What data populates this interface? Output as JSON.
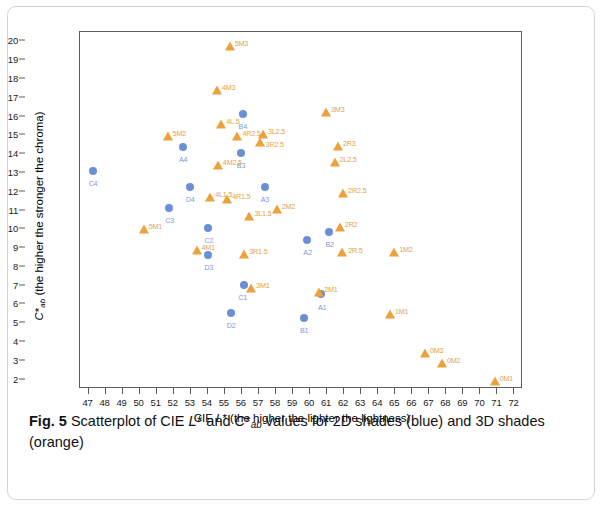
{
  "figure": {
    "label": "Fig. 5",
    "caption_part1": "Scatterplot of CIE ",
    "caption_italic1": "L",
    "caption_part2": "* and ",
    "caption_italic2": "C",
    "caption_part3": "*",
    "caption_sub": "ab",
    "caption_part4": " values for 2D shades (blue) and 3D shades (orange)"
  },
  "colors": {
    "blue_marker": "#6b8fd4",
    "blue_label": "#7e9ad6",
    "orange_marker": "#eda13c",
    "orange_label": "#e2a34a",
    "axis": "#5d5d5d",
    "card_border": "#d5d5d5"
  },
  "chart_data": {
    "type": "scatter",
    "title": "",
    "xlabel": "CIE L* (the higher the lighter the lightness)",
    "ylabel": "C*ab (the higher the stronger the chroma)",
    "xlabel_parts": {
      "pre": "CIE ",
      "italic": "L",
      "post": "* (the higher the lighter the lightness)"
    },
    "ylabel_parts": {
      "italic": "C",
      "star": "*",
      "sub": "ab",
      "post": " (the higher the stronger the chroma)"
    },
    "xlim": [
      46.5,
      72.5
    ],
    "ylim": [
      1.5,
      20.5
    ],
    "xticks": [
      47,
      48,
      49,
      50,
      51,
      52,
      53,
      54,
      55,
      56,
      57,
      58,
      59,
      60,
      61,
      62,
      63,
      64,
      65,
      66,
      67,
      68,
      69,
      70,
      71,
      72
    ],
    "yticks": [
      2,
      3,
      4,
      5,
      6,
      7,
      8,
      9,
      10,
      11,
      12,
      13,
      14,
      15,
      16,
      17,
      18,
      19,
      20
    ],
    "grid": false,
    "legend": "in-caption",
    "series": [
      {
        "name": "2D shades (blue)",
        "color": "#6b8fd4",
        "marker": "circle",
        "points": [
          {
            "label": "C4",
            "x": 47.3,
            "y": 13.05,
            "lx": -4,
            "ly": 9
          },
          {
            "label": "A4",
            "x": 52.6,
            "y": 14.3,
            "lx": -4,
            "ly": 9
          },
          {
            "label": "D4",
            "x": 53.0,
            "y": 12.2,
            "lx": -4,
            "ly": 9
          },
          {
            "label": "C3",
            "x": 51.8,
            "y": 11.1,
            "lx": -4,
            "ly": 9
          },
          {
            "label": "C2",
            "x": 54.1,
            "y": 10.0,
            "lx": -4,
            "ly": 9
          },
          {
            "label": "D3",
            "x": 54.1,
            "y": 8.6,
            "lx": -4,
            "ly": 9
          },
          {
            "label": "C1",
            "x": 56.2,
            "y": 7.0,
            "lx": -6,
            "ly": 9
          },
          {
            "label": "D2",
            "x": 55.4,
            "y": 5.5,
            "lx": -4,
            "ly": 9
          },
          {
            "label": "B1",
            "x": 59.7,
            "y": 5.25,
            "lx": -4,
            "ly": 9
          },
          {
            "label": "A1",
            "x": 60.7,
            "y": 6.5,
            "lx": -3,
            "ly": 10
          },
          {
            "label": "B2",
            "x": 61.2,
            "y": 9.8,
            "lx": -4,
            "ly": 9
          },
          {
            "label": "A2",
            "x": 59.9,
            "y": 9.4,
            "lx": -4,
            "ly": 9
          },
          {
            "label": "A3",
            "x": 57.4,
            "y": 12.2,
            "lx": -4,
            "ly": 9
          },
          {
            "label": "B3",
            "x": 56.0,
            "y": 14.0,
            "lx": -4,
            "ly": 9
          },
          {
            "label": "B4",
            "x": 56.1,
            "y": 16.1,
            "lx": -4,
            "ly": 9
          }
        ]
      },
      {
        "name": "3D shades (orange)",
        "color": "#eda13c",
        "marker": "triangle",
        "points": [
          {
            "label": "5M3",
            "x": 55.35,
            "y": 19.65,
            "lx": 5,
            "ly": -7
          },
          {
            "label": "4M3",
            "x": 54.6,
            "y": 17.3,
            "lx": 5,
            "ly": -7
          },
          {
            "label": "3M3",
            "x": 61.0,
            "y": 16.15,
            "lx": 5,
            "ly": -7
          },
          {
            "label": "5M2",
            "x": 51.7,
            "y": 14.85,
            "lx": 5,
            "ly": -7
          },
          {
            "label": "4L.5",
            "x": 54.85,
            "y": 15.5,
            "lx": 5,
            "ly": -7
          },
          {
            "label": "4R2.5",
            "x": 55.8,
            "y": 14.85,
            "lx": 5,
            "ly": -7
          },
          {
            "label": "3L2.5",
            "x": 57.3,
            "y": 14.95,
            "lx": 5,
            "ly": -7
          },
          {
            "label": "3R2.5",
            "x": 57.1,
            "y": 14.55,
            "lx": 6,
            "ly": -2
          },
          {
            "label": "2R3",
            "x": 61.7,
            "y": 14.35,
            "lx": 5,
            "ly": -7
          },
          {
            "label": "2L2.5",
            "x": 61.5,
            "y": 13.5,
            "lx": 5,
            "ly": -7
          },
          {
            "label": "4M2.5",
            "x": 54.65,
            "y": 13.3,
            "lx": 5,
            "ly": -7
          },
          {
            "label": "2R2.5",
            "x": 62.0,
            "y": 11.8,
            "lx": 5,
            "ly": -7
          },
          {
            "label": "5M1",
            "x": 50.3,
            "y": 9.9,
            "lx": 5,
            "ly": -7
          },
          {
            "label": "4L1.5",
            "x": 54.2,
            "y": 11.6,
            "lx": 5,
            "ly": -7
          },
          {
            "label": "4R1.5",
            "x": 55.2,
            "y": 11.5,
            "lx": 5,
            "ly": -7
          },
          {
            "label": "3L1.5",
            "x": 56.5,
            "y": 10.6,
            "lx": 5,
            "ly": -7
          },
          {
            "label": "2M2",
            "x": 58.1,
            "y": 11.0,
            "lx": 5,
            "ly": -7
          },
          {
            "label": "2R2",
            "x": 61.8,
            "y": 10.0,
            "lx": 5,
            "ly": -7
          },
          {
            "label": "4M1",
            "x": 53.4,
            "y": 8.8,
            "lx": 5,
            "ly": -7
          },
          {
            "label": "3R1.5",
            "x": 56.2,
            "y": 8.6,
            "lx": 5,
            "ly": -7
          },
          {
            "label": "2R.5",
            "x": 61.95,
            "y": 8.7,
            "lx": 6,
            "ly": -6
          },
          {
            "label": "1M2",
            "x": 65.0,
            "y": 8.7,
            "lx": 5,
            "ly": -7
          },
          {
            "label": "3M1",
            "x": 56.6,
            "y": 6.75,
            "lx": 5,
            "ly": -7
          },
          {
            "label": "2M1",
            "x": 60.6,
            "y": 6.55,
            "lx": 5,
            "ly": -7
          },
          {
            "label": "1M1",
            "x": 64.75,
            "y": 5.4,
            "lx": 5,
            "ly": -7
          },
          {
            "label": "0M3",
            "x": 66.8,
            "y": 3.3,
            "lx": 5,
            "ly": -7
          },
          {
            "label": "0M2",
            "x": 67.8,
            "y": 2.8,
            "lx": 5,
            "ly": -7
          },
          {
            "label": "0M1",
            "x": 70.9,
            "y": 1.8,
            "lx": 5,
            "ly": -7
          }
        ]
      }
    ]
  }
}
